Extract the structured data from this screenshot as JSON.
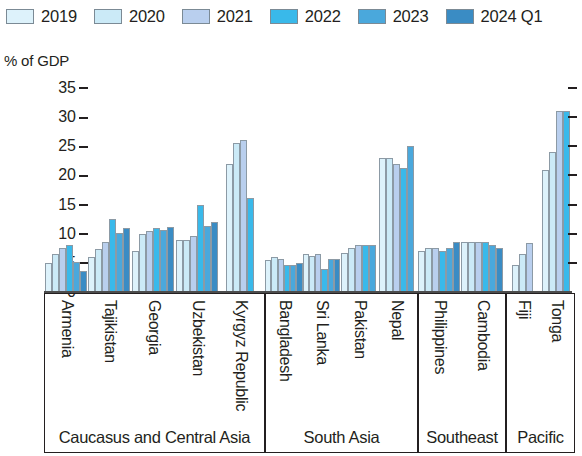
{
  "chart_data": {
    "type": "bar",
    "title": "",
    "xlabel": "",
    "ylabel": "% of GDP",
    "ylim": [
      0,
      35
    ],
    "yticks": [
      0,
      5,
      10,
      15,
      20,
      25,
      30,
      35
    ],
    "grid": false,
    "legend_position": "top",
    "series": [
      {
        "name": "2019",
        "color": "#ddf2fb"
      },
      {
        "name": "2020",
        "color": "#cbeaf7"
      },
      {
        "name": "2021",
        "color": "#b9cfee"
      },
      {
        "name": "2022",
        "color": "#39b9ea"
      },
      {
        "name": "2023",
        "color": "#4aa8dc"
      },
      {
        "name": "2024 Q1",
        "color": "#3a8cc4"
      }
    ],
    "regions": [
      {
        "name": "Caucasus and Central Asia",
        "countries": [
          {
            "name": "Armenia",
            "values": [
              5.0,
              6.6,
              7.6,
              8.1,
              5.1,
              3.6
            ]
          },
          {
            "name": "Tajikistan",
            "values": [
              6.0,
              7.4,
              8.6,
              12.5,
              10.1,
              11.0
            ]
          },
          {
            "name": "Georgia",
            "values": [
              7.0,
              9.9,
              10.4,
              11.0,
              10.6,
              11.1
            ]
          },
          {
            "name": "Uzbekistan",
            "values": [
              9.0,
              9.0,
              9.6,
              15.0,
              11.4,
              12.0
            ]
          },
          {
            "name": "Kyrgyz Republic",
            "values": [
              22.0,
              25.5,
              26.0,
              16.2,
              null,
              null
            ]
          }
        ]
      },
      {
        "name": "South Asia",
        "countries": [
          {
            "name": "Bangladesh",
            "values": [
              5.5,
              6.0,
              5.6,
              4.6,
              4.6,
              5.0
            ]
          },
          {
            "name": "Sri Lanka",
            "values": [
              6.5,
              6.1,
              6.6,
              4.0,
              5.6,
              5.6
            ]
          },
          {
            "name": "Pakistan",
            "values": [
              6.7,
              7.6,
              8.1,
              8.1,
              8.1,
              null
            ]
          },
          {
            "name": "Nepal",
            "values": [
              23.0,
              23.0,
              22.0,
              21.2,
              25.0,
              null
            ]
          }
        ]
      },
      {
        "name": "Southeast",
        "countries": [
          {
            "name": "Philippines",
            "values": [
              7.0,
              7.5,
              7.5,
              7.0,
              7.5,
              8.6
            ]
          },
          {
            "name": "Cambodia",
            "values": [
              8.6,
              8.6,
              8.6,
              8.6,
              8.1,
              7.6
            ]
          }
        ]
      },
      {
        "name": "Pacific",
        "countries": [
          {
            "name": "Fiji",
            "values": [
              4.6,
              6.6,
              8.4,
              null,
              null,
              null
            ]
          },
          {
            "name": "Tonga",
            "values": [
              21.0,
              24.1,
              31.1,
              31.0,
              null,
              null
            ]
          }
        ]
      }
    ]
  }
}
